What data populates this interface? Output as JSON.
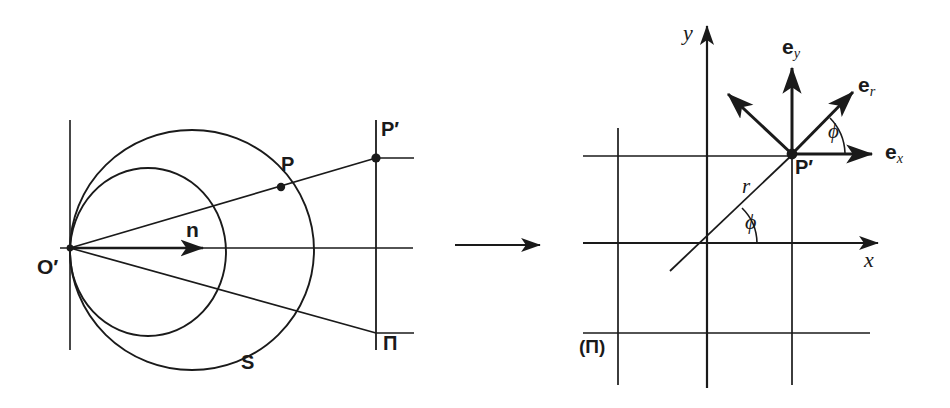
{
  "figure": {
    "ink_color": "#1a1a1a",
    "background": "#ffffff"
  },
  "left_panel": {
    "name": "stereographic-projection",
    "labels": {
      "origin": "O′",
      "normal_vector": "n",
      "sphere_point": "P",
      "plane_point": "P′",
      "sphere": "S",
      "plane": "Π"
    }
  },
  "arrow_between": {
    "name": "maps-to-arrow",
    "symbol": "→"
  },
  "right_panel": {
    "name": "polar-basis-on-plane",
    "labels": {
      "x_axis": "x",
      "y_axis": "y",
      "point": "P′",
      "radius": "r",
      "angle_at_origin": "ϕ",
      "angle_at_point": "ϕ",
      "basis_x_head": "e",
      "basis_x_sub": "x",
      "basis_y_head": "e",
      "basis_y_sub": "y",
      "basis_r_head": "e",
      "basis_r_sub": "r",
      "plane": "(Π)"
    }
  }
}
